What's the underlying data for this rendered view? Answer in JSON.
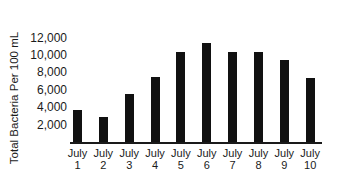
{
  "chart_data": {
    "type": "bar",
    "title": "",
    "xlabel": "",
    "ylabel": "Total Bacteria Per 100 mL",
    "ylim": [
      0,
      12000
    ],
    "yticks": [
      2000,
      4000,
      6000,
      8000,
      10000,
      12000
    ],
    "ytick_labels": [
      "2,000",
      "4,000",
      "6,000",
      "8,000",
      "10,000",
      "12,000"
    ],
    "grid": false,
    "legend": null,
    "categories": [
      "July 1",
      "July 2",
      "July 3",
      "July 4",
      "July 5",
      "July 6",
      "July 7",
      "July 8",
      "July 9",
      "July 10"
    ],
    "category_lines": [
      [
        "July",
        "1"
      ],
      [
        "July",
        "2"
      ],
      [
        "July",
        "3"
      ],
      [
        "July",
        "4"
      ],
      [
        "July",
        "5"
      ],
      [
        "July",
        "6"
      ],
      [
        "July",
        "7"
      ],
      [
        "July",
        "8"
      ],
      [
        "July",
        "9"
      ],
      [
        "July",
        "10"
      ]
    ],
    "values": [
      3800,
      3000,
      5600,
      7600,
      10500,
      11500,
      10500,
      10500,
      9500,
      7500
    ],
    "bar_color": "#111111"
  }
}
